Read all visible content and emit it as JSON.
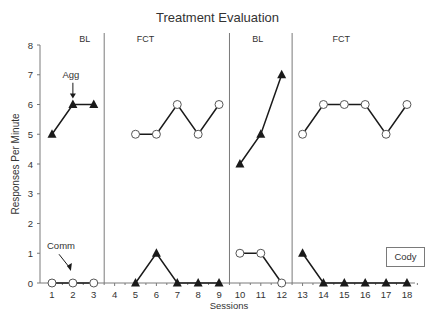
{
  "chart_data": {
    "type": "line",
    "title": "Treatment Evaluation",
    "xlabel": "Sessions",
    "ylabel": "Responses Per Minute",
    "ylim": [
      0,
      8
    ],
    "yticks": [
      0,
      1,
      2,
      3,
      4,
      5,
      6,
      7,
      8
    ],
    "xticks": [
      1,
      2,
      3,
      4,
      5,
      6,
      7,
      8,
      9,
      10,
      11,
      12,
      13,
      14,
      15,
      16,
      17,
      18
    ],
    "grid": false,
    "phases": [
      {
        "label": "BL",
        "sessions": [
          1,
          3
        ]
      },
      {
        "label": "FCT",
        "sessions": [
          5,
          9
        ]
      },
      {
        "label": "BL",
        "sessions": [
          10,
          12
        ]
      },
      {
        "label": "FCT",
        "sessions": [
          13,
          18
        ]
      }
    ],
    "phase_change_lines_after_session": [
      3.5,
      9.5,
      12.5
    ],
    "series": [
      {
        "name": "Agg",
        "marker": "filled-triangle",
        "segments": [
          {
            "x": [
              1,
              2,
              3
            ],
            "y": [
              5,
              6,
              6
            ]
          },
          {
            "x": [
              5,
              6,
              7,
              8,
              9
            ],
            "y": [
              0,
              1,
              0,
              0,
              0
            ]
          },
          {
            "x": [
              10,
              11,
              12
            ],
            "y": [
              4,
              5,
              7
            ]
          },
          {
            "x": [
              13,
              14,
              15,
              16,
              17,
              18
            ],
            "y": [
              1,
              0,
              0,
              0,
              0,
              0
            ]
          }
        ]
      },
      {
        "name": "Comm",
        "marker": "open-circle",
        "segments": [
          {
            "x": [
              1,
              2,
              3
            ],
            "y": [
              0,
              0,
              0
            ]
          },
          {
            "x": [
              5,
              6,
              7,
              8,
              9
            ],
            "y": [
              5,
              5,
              6,
              5,
              6
            ]
          },
          {
            "x": [
              10,
              11,
              12
            ],
            "y": [
              1,
              1,
              0
            ]
          },
          {
            "x": [
              13,
              14,
              15,
              16,
              17,
              18
            ],
            "y": [
              5,
              6,
              6,
              6,
              5,
              6
            ]
          }
        ]
      }
    ],
    "annotations": [
      {
        "text": "Agg",
        "arrow_to": {
          "x": 2,
          "y": 6
        }
      },
      {
        "text": "Comm",
        "arrow_to": {
          "x": 2,
          "y": 0
        }
      }
    ],
    "participant_label": "Cody"
  },
  "colors": {
    "line": "#1a1a1a",
    "axis": "#7a7a7a",
    "text": "#333333"
  }
}
